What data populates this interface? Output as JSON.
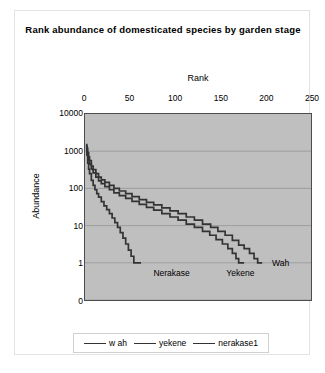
{
  "chart_data": {
    "type": "line",
    "title": "Rank abundance of domesticated species by garden stage",
    "xlabel": "Rank",
    "ylabel": "Abundance",
    "xlim": [
      0,
      250
    ],
    "ylim": [
      0,
      10000
    ],
    "yscale": "log-like",
    "grid": true,
    "xaxis_position": "top",
    "legend_position": "bottom",
    "xticks": [
      0,
      50,
      100,
      150,
      200,
      250
    ],
    "yticks": [
      10000,
      1000,
      100,
      10,
      1,
      0
    ],
    "ytick_labels": [
      "10000",
      "1000",
      "100",
      "10",
      "1",
      "0"
    ],
    "xtick_labels": [
      "0",
      "50",
      "100",
      "150",
      "200",
      "250"
    ],
    "plot_background": "#bfbfbf",
    "line_color": "#333333",
    "annotations": [
      {
        "text": "Wah",
        "x": 205,
        "y": 1
      },
      {
        "text": "Nerakase",
        "x": 75,
        "y": 0.55
      },
      {
        "text": "Yekene",
        "x": 155,
        "y": 0.55
      }
    ],
    "series": [
      {
        "name": "wah",
        "legend_label": "w ah",
        "color": "#333333",
        "points": [
          [
            1,
            1500
          ],
          [
            2,
            1200
          ],
          [
            3,
            900
          ],
          [
            4,
            700
          ],
          [
            5,
            560
          ],
          [
            7,
            400
          ],
          [
            9,
            320
          ],
          [
            12,
            250
          ],
          [
            15,
            200
          ],
          [
            18,
            170
          ],
          [
            22,
            145
          ],
          [
            27,
            120
          ],
          [
            32,
            100
          ],
          [
            38,
            85
          ],
          [
            45,
            72
          ],
          [
            52,
            60
          ],
          [
            60,
            50
          ],
          [
            68,
            42
          ],
          [
            76,
            36
          ],
          [
            85,
            30
          ],
          [
            94,
            25
          ],
          [
            103,
            21
          ],
          [
            112,
            17
          ],
          [
            121,
            14
          ],
          [
            130,
            11
          ],
          [
            139,
            9
          ],
          [
            147,
            7
          ],
          [
            155,
            5.5
          ],
          [
            163,
            4
          ],
          [
            170,
            3
          ],
          [
            176,
            2.4
          ],
          [
            182,
            1.8
          ],
          [
            187,
            1.3
          ],
          [
            191,
            1
          ],
          [
            196,
            1
          ]
        ]
      },
      {
        "name": "yekene",
        "legend_label": "yekene",
        "color": "#333333",
        "points": [
          [
            1,
            1300
          ],
          [
            2,
            950
          ],
          [
            3,
            720
          ],
          [
            4,
            560
          ],
          [
            5,
            450
          ],
          [
            7,
            330
          ],
          [
            9,
            260
          ],
          [
            12,
            200
          ],
          [
            15,
            160
          ],
          [
            18,
            135
          ],
          [
            22,
            112
          ],
          [
            27,
            92
          ],
          [
            32,
            76
          ],
          [
            38,
            64
          ],
          [
            45,
            54
          ],
          [
            52,
            45
          ],
          [
            60,
            37
          ],
          [
            68,
            31
          ],
          [
            76,
            26
          ],
          [
            85,
            21
          ],
          [
            94,
            17
          ],
          [
            103,
            14
          ],
          [
            112,
            11
          ],
          [
            121,
            9
          ],
          [
            130,
            7
          ],
          [
            138,
            5.5
          ],
          [
            145,
            4.2
          ],
          [
            152,
            3.2
          ],
          [
            158,
            2.4
          ],
          [
            163,
            1.8
          ],
          [
            167,
            1.3
          ],
          [
            170,
            1
          ],
          [
            176,
            1
          ]
        ]
      },
      {
        "name": "nerakase1",
        "legend_label": "nerakase1",
        "color": "#333333",
        "points": [
          [
            1,
            1400
          ],
          [
            2,
            800
          ],
          [
            3,
            480
          ],
          [
            4,
            330
          ],
          [
            5,
            250
          ],
          [
            7,
            165
          ],
          [
            9,
            120
          ],
          [
            11,
            92
          ],
          [
            13,
            72
          ],
          [
            15,
            58
          ],
          [
            18,
            44
          ],
          [
            21,
            34
          ],
          [
            24,
            27
          ],
          [
            27,
            21
          ],
          [
            30,
            16
          ],
          [
            33,
            12
          ],
          [
            36,
            9
          ],
          [
            39,
            6.5
          ],
          [
            42,
            4.6
          ],
          [
            45,
            3.2
          ],
          [
            48,
            2.2
          ],
          [
            51,
            1.5
          ],
          [
            54,
            1
          ],
          [
            62,
            1
          ]
        ]
      }
    ]
  },
  "legend": {
    "entries": [
      {
        "label": "w ah"
      },
      {
        "label": "yekene"
      },
      {
        "label": "nerakase1"
      }
    ]
  }
}
